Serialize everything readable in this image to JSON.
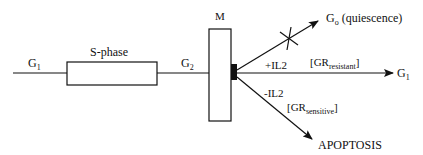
{
  "diagram": {
    "type": "cell-cycle-flow",
    "colors": {
      "stroke": "#111111",
      "background": "#ffffff",
      "block": "#111111"
    },
    "phases": {
      "g1_start": {
        "main": "G",
        "sub": "1"
      },
      "s_phase": {
        "label": "S-phase"
      },
      "g2": {
        "main": "G",
        "sub": "2"
      },
      "mitosis": {
        "label": "M"
      }
    },
    "branches": {
      "quiescence": {
        "main": "G",
        "sub": "o",
        "suffix": " (quiescence)",
        "blocked": true
      },
      "continue": {
        "condition": "+IL2",
        "gr_open": "[GR",
        "gr_sub": "resistant",
        "gr_close": "]",
        "target_main": "G",
        "target_sub": "1"
      },
      "apoptosis": {
        "condition": "-IL2",
        "gr_open": "[GR",
        "gr_sub": "sensitive",
        "gr_close": "]",
        "target": "APOPTOSIS"
      }
    }
  }
}
